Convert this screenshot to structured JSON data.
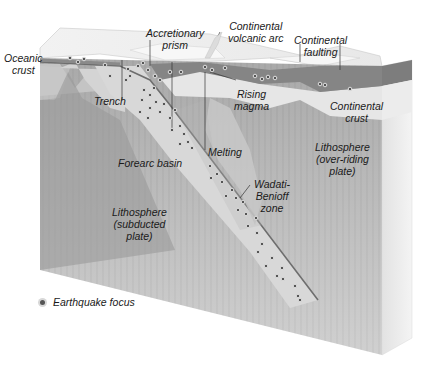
{
  "diagram": {
    "labels": {
      "oceanic_crust": [
        "Oceanic",
        "crust"
      ],
      "accretionary_prism": [
        "Accretionary",
        "prism"
      ],
      "continental_volcanic_arc": [
        "Continental",
        "volcanic arc"
      ],
      "continental_faulting": [
        "Continental",
        "faulting"
      ],
      "trench": [
        "Trench"
      ],
      "rising_magma": [
        "Rising",
        "magma"
      ],
      "continental_crust": [
        "Continental",
        "crust"
      ],
      "forearc_basin": [
        "Forearc basin"
      ],
      "melting": [
        "Melting"
      ],
      "lithosphere_overriding": [
        "Lithosphere",
        "(over-riding",
        "plate)"
      ],
      "wadati_benioff": [
        "Wadati-",
        "Benioff",
        "zone"
      ],
      "lithosphere_subducted": [
        "Lithosphere",
        "(subducted",
        "plate)"
      ]
    },
    "legend": {
      "earthquake_focus": "Earthquake focus"
    },
    "colors": {
      "lithosphere": "#9c9c9c",
      "lithosphere_light": "#b8b8b8",
      "slab": "#d6d6d6",
      "oceanic_crust_band": "#7d7d7d",
      "continental_crust": "#e4e4e4",
      "top_surface": "#eeeeee",
      "side_face": "#e8e8e8",
      "earthquake_dot": "#555555",
      "leader_line": "#333333"
    }
  }
}
